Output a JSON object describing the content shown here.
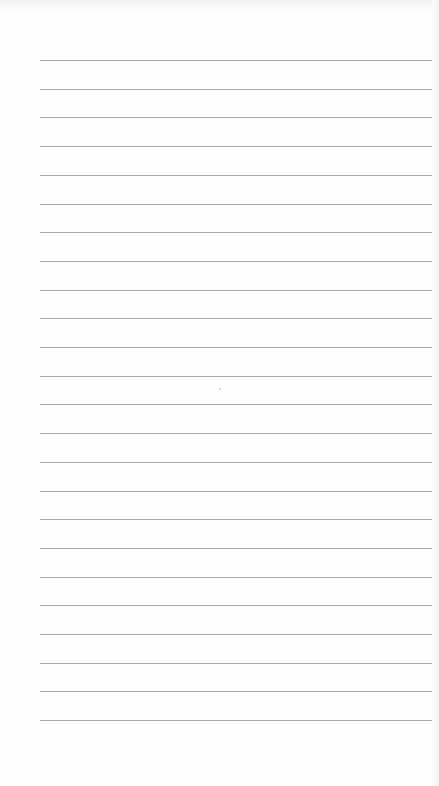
{
  "page": {
    "type": "ruled-paper",
    "background_color": "#fefefe",
    "line_color": "#a9a9a9",
    "line_count": 24,
    "first_line_y": 60,
    "line_spacing": 28.7,
    "line_left": 40,
    "line_width": 392
  }
}
